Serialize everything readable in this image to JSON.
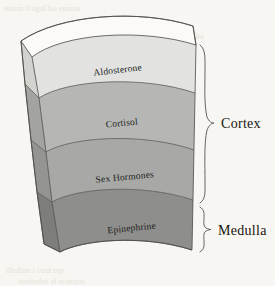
{
  "figure": {
    "background_color": "#f7f6f2"
  },
  "layers": [
    {
      "id": "aldosterone",
      "label": "Aldosterone",
      "color": "#e2e2e0",
      "side_color": "#d2d2cf",
      "group": "Cortex"
    },
    {
      "id": "cortisol",
      "label": "Cortisol",
      "color": "#b6b6b4",
      "side_color": "#a3a3a0",
      "group": "Cortex"
    },
    {
      "id": "sex-hormones",
      "label": "Sex Hormones",
      "color": "#a8a8a6",
      "side_color": "#949492",
      "group": "Cortex"
    },
    {
      "id": "epinephrine",
      "label": "Epinephrine",
      "color": "#8e8e8c",
      "side_color": "#7d7d7b",
      "group": "Medulla"
    }
  ],
  "top_face": {
    "color": "#fbfaf7",
    "label": ""
  },
  "groups": [
    {
      "id": "cortex",
      "label": "Cortex",
      "covers": [
        "Aldosterone",
        "Cortisol",
        "Sex Hormones"
      ]
    },
    {
      "id": "medulla",
      "label": "Medulla",
      "covers": [
        "Epinephrine"
      ]
    }
  ],
  "background_bleed": [
    {
      "text": "sutem il ogul lus enoiza",
      "x": 4,
      "y": 4
    },
    {
      "text": "onoizanimretedni",
      "x": 148,
      "y": 32
    },
    {
      "text": "illedom i ottut rep",
      "x": 6,
      "y": 266
    },
    {
      "text": "enoizulos al erutturts",
      "x": 18,
      "y": 277
    }
  ]
}
